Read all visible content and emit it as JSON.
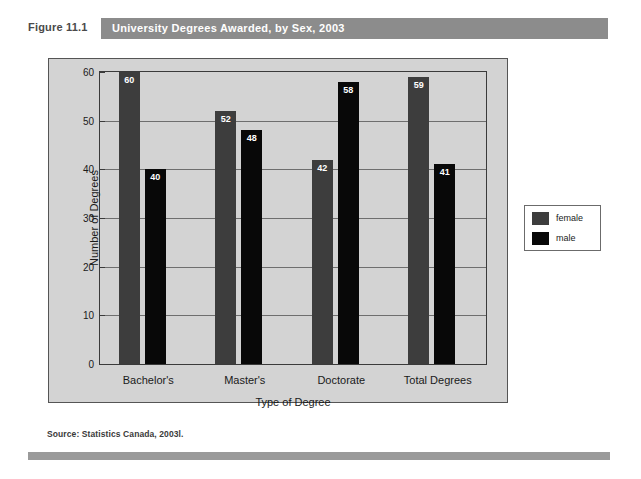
{
  "figure": {
    "number": "Figure 11.1",
    "title": "University Degrees Awarded, by Sex, 2003",
    "source": "Source: Statistics Canada, 2003l."
  },
  "colors": {
    "title_bar": "#8c8c8c",
    "panel_bg": "#d3d3d3",
    "female_bar": "#3d3d3d",
    "male_bar": "#080808",
    "footer_bar": "#9a9a9a"
  },
  "legend": {
    "position": "right",
    "entries": [
      {
        "label": "female",
        "color": "#3d3d3d"
      },
      {
        "label": "male",
        "color": "#080808"
      }
    ]
  },
  "chart_data": {
    "type": "bar",
    "title": "University Degrees Awarded, by Sex, 2003",
    "xlabel": "Type of Degree",
    "ylabel": "Number of Degrees",
    "categories": [
      "Bachelor's",
      "Master's",
      "Doctorate",
      "Total Degrees"
    ],
    "series": [
      {
        "name": "female",
        "color": "#3d3d3d",
        "values": [
          60,
          52,
          42,
          59
        ]
      },
      {
        "name": "male",
        "color": "#080808",
        "values": [
          40,
          48,
          58,
          41
        ]
      }
    ],
    "ylim": [
      0,
      60
    ],
    "yticks": [
      0,
      10,
      20,
      30,
      40,
      50,
      60
    ],
    "ytick_labels": [
      "0",
      "10",
      "20",
      "30",
      "40",
      "50",
      "60"
    ],
    "grid": true,
    "data_labels": true,
    "legend_position": "right"
  }
}
